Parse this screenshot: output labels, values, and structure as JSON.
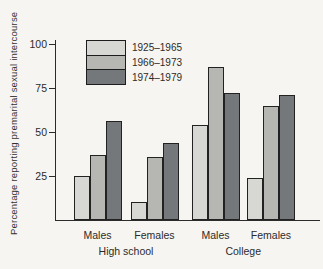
{
  "chart_data": {
    "type": "bar",
    "title": "",
    "ylabel": "Percentage reporting premarital sexual intercourse",
    "xlabel": "",
    "ylim": [
      0,
      100
    ],
    "yticks_display": [
      100,
      75,
      50,
      25
    ],
    "grid": false,
    "legend_position": "upper-left-inside",
    "categories": [
      "Males",
      "Females",
      "Males",
      "Females"
    ],
    "group_labels": [
      "High school",
      "College"
    ],
    "series": [
      {
        "name": "1925–1965",
        "color": "#d7d7d3",
        "values": [
          25,
          10,
          54,
          24
        ]
      },
      {
        "name": "1966–1973",
        "color": "#b6b7b2",
        "values": [
          37,
          36,
          87,
          65
        ]
      },
      {
        "name": "1974–1979",
        "color": "#75787a",
        "values": [
          56,
          44,
          72,
          71
        ]
      }
    ]
  },
  "colors": {
    "background": "#f7f5f1",
    "axis": "#2b2b2b",
    "bar_border": "#222222",
    "light_bar": "#d7d7d3",
    "medium_bar": "#b6b7b2",
    "dark_bar": "#75787a"
  }
}
